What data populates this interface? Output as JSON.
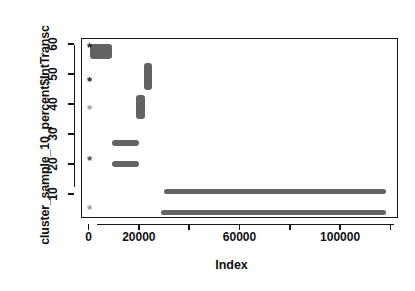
{
  "chart_data": {
    "type": "scatter",
    "title": "",
    "xlabel": "Index",
    "ylabel": "cluster_sample_10_percent$IntTransc",
    "xlim": [
      -3000,
      123000
    ],
    "ylim": [
      2,
      62
    ],
    "grid": false,
    "legend": null,
    "point_color": "#636363",
    "marker_color_dark": "#1b1b1b",
    "xticks": [
      0,
      20000,
      40000,
      60000,
      80000,
      100000,
      120000
    ],
    "xticklabels": [
      "0",
      "20000",
      "",
      "60000",
      "",
      "100000",
      ""
    ],
    "yticks": [
      10,
      20,
      30,
      40,
      50,
      60
    ],
    "yticklabels": [
      "10",
      "20",
      "30",
      "40",
      "50",
      "60"
    ],
    "clusters": [
      {
        "name": "band-60-top",
        "x_start": 200,
        "x_end": 9000,
        "y_low": 55.5,
        "y_high": 60.5
      },
      {
        "name": "band-53",
        "x_start": 21500,
        "x_end": 25000,
        "y_low": 45.0,
        "y_high": 54.0
      },
      {
        "name": "band-40",
        "x_start": 18500,
        "x_end": 22000,
        "y_low": 35.5,
        "y_high": 43.5
      },
      {
        "name": "band-27",
        "x_start": 9000,
        "x_end": 19500,
        "y_low": 26.5,
        "y_high": 28.5
      },
      {
        "name": "band-20",
        "x_start": 9000,
        "x_end": 19500,
        "y_low": 19.5,
        "y_high": 21.5
      },
      {
        "name": "band-11-long",
        "x_start": 29500,
        "x_end": 118000,
        "y_low": 10.5,
        "y_high": 12.0
      },
      {
        "name": "band-4-long",
        "x_start": 28500,
        "x_end": 118000,
        "y_low": 3.5,
        "y_high": 5.0
      }
    ],
    "markers": [
      {
        "name": "marker-60",
        "x": 0,
        "y": 59.5,
        "glyph": "*",
        "shade": "dark"
      },
      {
        "name": "marker-48",
        "x": 0,
        "y": 48.0,
        "glyph": "*",
        "shade": "dark"
      },
      {
        "name": "marker-39",
        "x": 0,
        "y": 38.7,
        "glyph": "*",
        "shade": "light"
      },
      {
        "name": "marker-22",
        "x": 0,
        "y": 21.8,
        "glyph": "*",
        "shade": "mid"
      },
      {
        "name": "marker-5",
        "x": 0,
        "y": 5.5,
        "glyph": "*",
        "shade": "light"
      }
    ]
  }
}
